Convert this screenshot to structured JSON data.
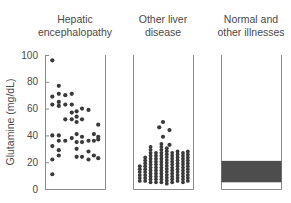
{
  "chart_data": {
    "type": "scatter",
    "title": "",
    "xlabel": "",
    "ylabel": "Glutamine (mg/dL)",
    "ylim": [
      0,
      100
    ],
    "yticks": [
      0,
      20,
      40,
      60,
      80,
      100
    ],
    "grid": false,
    "legend": null,
    "categories": [
      "Hepatic encephalopathy",
      "Other liver disease",
      "Normal and other illnesses"
    ],
    "panels": [
      {
        "label_lines": [
          "Hepatic",
          "encephalopathy"
        ],
        "kind": "dots",
        "points": [
          [
            0.08,
            96
          ],
          [
            0.08,
            69
          ],
          [
            0.08,
            63
          ],
          [
            0.08,
            40
          ],
          [
            0.08,
            32
          ],
          [
            0.08,
            22
          ],
          [
            0.08,
            11
          ],
          [
            0.2,
            77
          ],
          [
            0.2,
            71
          ],
          [
            0.2,
            65
          ],
          [
            0.2,
            62
          ],
          [
            0.2,
            40
          ],
          [
            0.2,
            36
          ],
          [
            0.2,
            29
          ],
          [
            0.2,
            25
          ],
          [
            0.32,
            70
          ],
          [
            0.32,
            63
          ],
          [
            0.32,
            52
          ],
          [
            0.32,
            36
          ],
          [
            0.44,
            71
          ],
          [
            0.44,
            63
          ],
          [
            0.44,
            57
          ],
          [
            0.44,
            52
          ],
          [
            0.44,
            38
          ],
          [
            0.53,
            58
          ],
          [
            0.53,
            54
          ],
          [
            0.53,
            50
          ],
          [
            0.53,
            41
          ],
          [
            0.53,
            35
          ],
          [
            0.53,
            30
          ],
          [
            0.53,
            24
          ],
          [
            0.63,
            60
          ],
          [
            0.63,
            52
          ],
          [
            0.63,
            39
          ],
          [
            0.63,
            35
          ],
          [
            0.63,
            24
          ],
          [
            0.75,
            59
          ],
          [
            0.75,
            36
          ],
          [
            0.75,
            28
          ],
          [
            0.75,
            22
          ],
          [
            0.85,
            41
          ],
          [
            0.85,
            36
          ],
          [
            0.85,
            25
          ],
          [
            0.93,
            48
          ],
          [
            0.93,
            39
          ],
          [
            0.93,
            37
          ],
          [
            0.93,
            23
          ]
        ]
      },
      {
        "label_lines": [
          "Other liver",
          "disease"
        ],
        "kind": "dot_columns",
        "columns": [
          {
            "x": 0.07,
            "min": 6,
            "max": 17
          },
          {
            "x": 0.17,
            "min": 6,
            "max": 25
          },
          {
            "x": 0.27,
            "min": 5,
            "max": 33
          },
          {
            "x": 0.37,
            "min": 5,
            "max": 28
          },
          {
            "x": 0.47,
            "min": 5,
            "max": 35
          },
          {
            "x": 0.57,
            "min": 4,
            "max": 31
          },
          {
            "x": 0.67,
            "min": 5,
            "max": 28
          },
          {
            "x": 0.77,
            "min": 6,
            "max": 30
          },
          {
            "x": 0.87,
            "min": 5,
            "max": 27
          },
          {
            "x": 0.96,
            "min": 6,
            "max": 28
          }
        ],
        "outliers": [
          [
            0.5,
            50
          ],
          [
            0.43,
            46
          ],
          [
            0.62,
            44
          ],
          [
            0.5,
            39
          ],
          [
            0.62,
            33
          ]
        ]
      },
      {
        "label_lines": [
          "Normal and",
          "other illnesses"
        ],
        "kind": "range_band",
        "range": [
          5,
          21
        ],
        "band_color": "#4d4d4d"
      }
    ]
  }
}
